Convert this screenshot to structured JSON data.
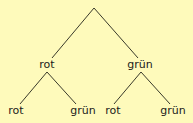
{
  "diagram": {
    "type": "probability-tree",
    "background": "#FEFABB",
    "line_color": "#3a3a2a",
    "root": {
      "x": 94,
      "y": 8
    },
    "level1": [
      {
        "label": "rot",
        "x": 47,
        "y": 58,
        "children": [
          {
            "label": "rot",
            "x": 16,
            "y": 104
          },
          {
            "label": "grün",
            "x": 83,
            "y": 104
          }
        ]
      },
      {
        "label": "grün",
        "x": 140,
        "y": 58,
        "children": [
          {
            "label": "rot",
            "x": 113,
            "y": 104
          },
          {
            "label": "grün",
            "x": 173,
            "y": 104
          }
        ]
      }
    ]
  }
}
